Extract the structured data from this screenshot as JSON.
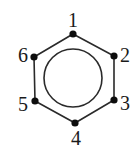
{
  "diagram": {
    "type": "benzene-ring",
    "colors": {
      "stroke": "#2a2a2a",
      "dot": "#0d0d0d",
      "label": "#1a1a1a",
      "background": "#ffffff"
    },
    "vertices": [
      {
        "id": "1",
        "label": "1",
        "x": 73,
        "y": 34,
        "label_x": 73,
        "label_y": 27,
        "anchor": "middle"
      },
      {
        "id": "2",
        "label": "2",
        "x": 114,
        "y": 56,
        "label_x": 120,
        "label_y": 62,
        "anchor": "start"
      },
      {
        "id": "3",
        "label": "3",
        "x": 114,
        "y": 100,
        "label_x": 120,
        "label_y": 110,
        "anchor": "start"
      },
      {
        "id": "4",
        "label": "4",
        "x": 75,
        "y": 123,
        "label_x": 76,
        "label_y": 145,
        "anchor": "middle"
      },
      {
        "id": "5",
        "label": "5",
        "x": 35,
        "y": 101,
        "label_x": 28,
        "label_y": 111,
        "anchor": "end"
      },
      {
        "id": "6",
        "label": "6",
        "x": 34,
        "y": 57,
        "label_x": 28,
        "label_y": 62,
        "anchor": "end"
      }
    ],
    "inner_circle": {
      "cx": 73,
      "cy": 78,
      "r": 29
    }
  }
}
